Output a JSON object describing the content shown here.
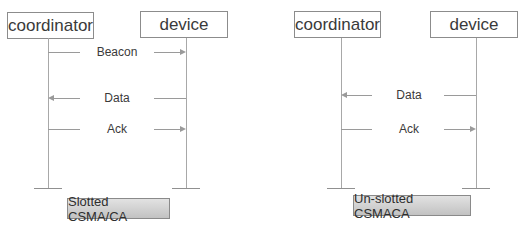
{
  "diagrams": [
    {
      "name": "slotted",
      "actors": {
        "left": "coordinator",
        "right": "device"
      },
      "messages": [
        {
          "label": "Beacon",
          "direction": "coordinator-to-device"
        },
        {
          "label": "Data",
          "direction": "device-to-coordinator"
        },
        {
          "label": "Ack",
          "direction": "coordinator-to-device"
        }
      ],
      "caption": "Slotted CSMA/CA"
    },
    {
      "name": "unslotted",
      "actors": {
        "left": "coordinator",
        "right": "device"
      },
      "messages": [
        {
          "label": "Data",
          "direction": "device-to-coordinator"
        },
        {
          "label": "Ack",
          "direction": "coordinator-to-device"
        }
      ],
      "caption": "Un-slotted CSMACA"
    }
  ],
  "colors": {
    "line": "#9a9a9a",
    "border": "#8c8c8c",
    "text": "#3a3a3a",
    "caption_gradient_top": "#e2e2e2",
    "caption_gradient_bottom": "#c2c2c2"
  }
}
